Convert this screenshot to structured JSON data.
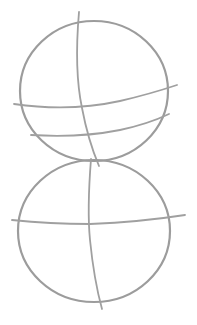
{
  "image": {
    "description": "Pencil construction sketch of two stacked circles with guide lines",
    "stroke_color": "#9c9c9c",
    "background": "#ffffff"
  },
  "shapes": {
    "top_circle": {
      "cx": 94,
      "cy": 91,
      "rx": 74,
      "ry": 70
    },
    "bottom_circle": {
      "cx": 94,
      "cy": 231,
      "rx": 76,
      "ry": 71
    }
  }
}
